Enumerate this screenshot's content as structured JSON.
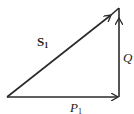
{
  "diagram": {
    "type": "vector-triangle",
    "stroke_color": "#2a2a2a",
    "vertices": {
      "origin": [
        7,
        97
      ],
      "bottom_right": [
        119,
        97
      ],
      "top_right": [
        119,
        8
      ]
    },
    "vectors": [
      {
        "name": "S",
        "subscript": "1",
        "style": "bold",
        "from": "origin",
        "to": "top_right"
      },
      {
        "name": "Q",
        "subscript": "",
        "style": "italic",
        "from": "bottom_right",
        "to": "top_right"
      },
      {
        "name": "P",
        "subscript": "1",
        "style": "italic",
        "from": "origin",
        "to": "bottom_right"
      }
    ],
    "labels": {
      "s1": {
        "main": "S",
        "sub": "1"
      },
      "q": {
        "main": "Q"
      },
      "p1": {
        "main": "P",
        "sub": "1"
      }
    }
  }
}
